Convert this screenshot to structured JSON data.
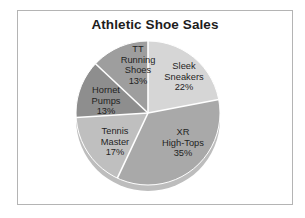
{
  "chart_data": {
    "type": "pie",
    "title": "Athletic Shoe Sales",
    "categories": [
      "Sleek Sneakers",
      "XR High-Tops",
      "Tennis Master",
      "Hornet Pumps",
      "TT Running Shoes"
    ],
    "values": [
      22,
      35,
      17,
      13,
      13
    ],
    "value_unit": "%",
    "colors": [
      "#d6d6d6",
      "#a9a9a9",
      "#bfbfbf",
      "#8e8e8e",
      "#9e9e9e"
    ],
    "slice_separator_color": "#ffffff",
    "legend": "none",
    "labels_inside_slices": true,
    "slices": [
      {
        "name": "Sleek Sneakers",
        "value": 22,
        "label_lines": [
          "Sleek",
          "Sneakers",
          "22%"
        ],
        "color": "#d6d6d6"
      },
      {
        "name": "XR High-Tops",
        "value": 35,
        "label_lines": [
          "XR",
          "High-Tops",
          "35%"
        ],
        "color": "#a9a9a9"
      },
      {
        "name": "Tennis Master",
        "value": 17,
        "label_lines": [
          "Tennis",
          "Master",
          "17%"
        ],
        "color": "#bfbfbf"
      },
      {
        "name": "Hornet Pumps",
        "value": 13,
        "label_lines": [
          "Hornet",
          "Pumps",
          "13%"
        ],
        "color": "#8e8e8e"
      },
      {
        "name": "TT Running Shoes",
        "value": 13,
        "label_lines": [
          "TT",
          "Running",
          "Shoes",
          "13%"
        ],
        "color": "#9e9e9e"
      }
    ]
  },
  "chart": {
    "title": "Athletic Shoe Sales"
  },
  "labels": {
    "tt": {
      "l1": "TT",
      "l2": "Running",
      "l3": "Shoes",
      "l4": "13%"
    },
    "sleek": {
      "l1": "Sleek",
      "l2": "Sneakers",
      "l3": "22%"
    },
    "xr": {
      "l1": "XR",
      "l2": "High-Tops",
      "l3": "35%"
    },
    "tennis": {
      "l1": "Tennis",
      "l2": "Master",
      "l3": "17%"
    },
    "hornet": {
      "l1": "Hornet",
      "l2": "Pumps",
      "l3": "13%"
    }
  }
}
